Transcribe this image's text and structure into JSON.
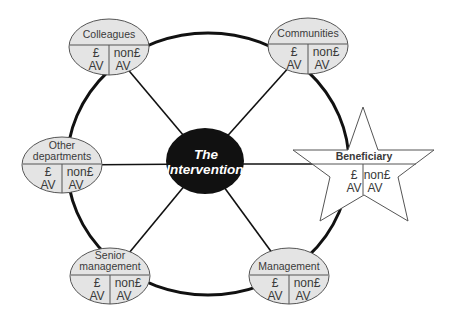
{
  "diagram": {
    "center": {
      "line1": "The",
      "line2": "Intervention",
      "fill": "#111111",
      "text_color": "#ffffff"
    },
    "colors": {
      "node_fill": "#e4e4e4",
      "node_stroke": "#555555",
      "ring_stroke": "#111111",
      "text": "#3a3a3a"
    },
    "nodes": [
      {
        "id": "colleagues",
        "label_lines": [
          "Colleagues"
        ],
        "left_top": "£",
        "left_bottom": "AV",
        "right_top": "non£",
        "right_bottom": "AV"
      },
      {
        "id": "communities",
        "label_lines": [
          "Communities"
        ],
        "left_top": "£",
        "left_bottom": "AV",
        "right_top": "non£",
        "right_bottom": "AV"
      },
      {
        "id": "other-departments",
        "label_lines": [
          "Other",
          "departments"
        ],
        "left_top": "£",
        "left_bottom": "AV",
        "right_top": "non£",
        "right_bottom": "AV"
      },
      {
        "id": "beneficiary",
        "label_lines": [
          "Beneficiary"
        ],
        "left_top": "£",
        "left_bottom": "AV",
        "right_top": "non£",
        "right_bottom": "AV",
        "shape": "star"
      },
      {
        "id": "senior-management",
        "label_lines": [
          "Senior",
          "management"
        ],
        "left_top": "£",
        "left_bottom": "AV",
        "right_top": "non£",
        "right_bottom": "AV"
      },
      {
        "id": "management",
        "label_lines": [
          "Management"
        ],
        "left_top": "£",
        "left_bottom": "AV",
        "right_top": "non£",
        "right_bottom": "AV"
      }
    ]
  }
}
